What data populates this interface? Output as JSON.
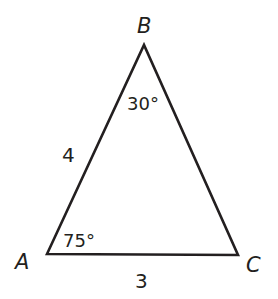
{
  "diagram": {
    "type": "triangle",
    "stroke_color": "#231f20",
    "background": "#ffffff",
    "vertices": [
      {
        "name": "A",
        "x": 47,
        "y": 254
      },
      {
        "name": "B",
        "x": 144,
        "y": 45
      },
      {
        "name": "C",
        "x": 238,
        "y": 255
      }
    ],
    "vertex_labels": {
      "A": "A",
      "B": "B",
      "C": "C"
    },
    "sides": {
      "AB": "4",
      "AC": "3"
    },
    "angles": {
      "A": "75°",
      "B": "30°"
    }
  }
}
